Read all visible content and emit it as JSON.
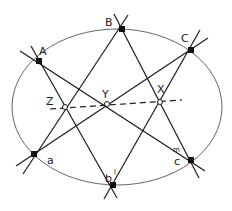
{
  "diagram": {
    "type": "pascal-hexagon-on-ellipse",
    "colors": {
      "line": "#1a1a1a",
      "ellipse": "#555555",
      "point": "#111111",
      "open_point_fill": "#ffffff"
    },
    "ellipse": {
      "cx": 117,
      "cy": 107,
      "rx": 105,
      "ry": 78
    },
    "points": {
      "A": {
        "label": "A",
        "x": 39,
        "y": 61
      },
      "B": {
        "label": "B",
        "x": 122,
        "y": 29
      },
      "C": {
        "label": "C",
        "x": 191,
        "y": 50
      },
      "a": {
        "label": "a",
        "x": 34,
        "y": 154
      },
      "b": {
        "label": "b",
        "x": 113,
        "y": 185
      },
      "c": {
        "label": "c",
        "x": 191,
        "y": 160
      }
    },
    "intersections": {
      "Z": {
        "label": "Z",
        "x": 65,
        "y": 107
      },
      "Y": {
        "label": "Y",
        "x": 107,
        "y": 104
      },
      "X": {
        "label": "X",
        "x": 160,
        "y": 102
      }
    },
    "extra_labels": {
      "b_prime_mark": "l",
      "m_mark": "m"
    },
    "pascal_line": {
      "style": "dashed",
      "from": [
        50,
        109
      ],
      "to": [
        182,
        100
      ]
    }
  }
}
